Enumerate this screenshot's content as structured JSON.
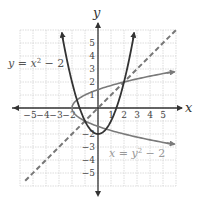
{
  "chart_data": {
    "type": "line",
    "title": "",
    "xlabel": "x",
    "ylabel": "y",
    "xlim": [
      -6,
      6
    ],
    "ylim": [
      -6,
      6
    ],
    "grid": true,
    "x_ticks": [
      "-5",
      "-4",
      "-3",
      "-2",
      "1",
      "2",
      "3",
      "4",
      "5"
    ],
    "y_ticks": [
      "5",
      "4",
      "3",
      "2",
      "1",
      "-2",
      "-3",
      "-4",
      "-5"
    ],
    "series": [
      {
        "name": "y = x^2 - 2",
        "label": "y = x² − 2",
        "style": "solid",
        "color": "#3a3a3a",
        "equation": "y = x^2 - 2",
        "x_range": [
          -2.8,
          2.8
        ]
      },
      {
        "name": "x = y^2 - 2",
        "label": "x = y² − 2",
        "style": "solid",
        "color": "#777777",
        "equation": "x = y^2 - 2",
        "y_range": [
          -2.8,
          2.8
        ]
      },
      {
        "name": "y = x",
        "label": "",
        "style": "dashed",
        "color": "#777777",
        "equation": "y = x",
        "x_range": [
          -6,
          6
        ]
      }
    ],
    "annotations": [
      {
        "text": "y = x² − 2",
        "near": [
          -5.5,
          3
        ]
      },
      {
        "text": "x = y² − 2",
        "near": [
          2.2,
          -3
        ]
      }
    ],
    "intersections": [
      [
        2,
        2
      ],
      [
        -1,
        -1
      ]
    ]
  },
  "labels": {
    "x_axis": "x",
    "y_axis": "y",
    "curve1": "y = x",
    "curve1_sup": "2",
    "curve1_rest": " − 2",
    "curve2": "x = y",
    "curve2_sup": "2",
    "curve2_rest": " − 2"
  },
  "colors": {
    "grid": "#cfcfcf",
    "axis": "#333333",
    "parabola_up": "#333333",
    "parabola_side": "#7a7a7a",
    "dashed_line": "#777777"
  }
}
